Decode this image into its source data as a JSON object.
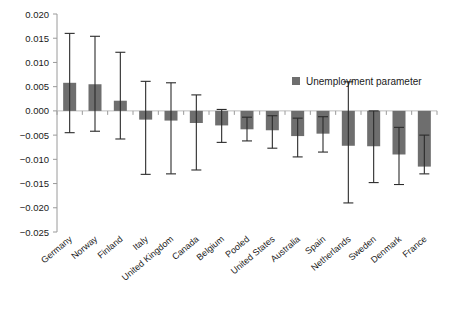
{
  "chart_data": {
    "type": "bar",
    "title": "",
    "xlabel": "",
    "ylabel": "",
    "ylim": [
      -0.025,
      0.02
    ],
    "ytick_values": [
      0.02,
      0.015,
      0.01,
      0.005,
      0.0,
      -0.005,
      -0.01,
      -0.015,
      -0.02,
      -0.025
    ],
    "ytick_labels": [
      "0.020",
      "0.015",
      "0.010",
      "0.005",
      "0.000",
      "−0.005",
      "−0.010",
      "−0.015",
      "−0.020",
      "−0.025"
    ],
    "grid": false,
    "legend": {
      "position": "inside-top-right",
      "entries": [
        {
          "name": "Unemployment parameter",
          "color": "#6e6e6e",
          "marker": "square"
        }
      ]
    },
    "categories": [
      "Germany",
      "Norway",
      "Finland",
      "Italy",
      "United Kingdom",
      "Canada",
      "Belgium",
      "Pooled",
      "United States",
      "Australia",
      "Spain",
      "Netherlands",
      "Sweden",
      "Denmark",
      "France"
    ],
    "series": [
      {
        "name": "Unemployment parameter",
        "color": "#6e6e6e",
        "values": [
          0.0058,
          0.0055,
          0.0021,
          -0.0018,
          -0.002,
          -0.0025,
          -0.003,
          -0.0038,
          -0.004,
          -0.0052,
          -0.0047,
          -0.0072,
          -0.0073,
          -0.009,
          -0.0115
        ],
        "error_low": [
          -0.0045,
          -0.0042,
          -0.0058,
          -0.0131,
          -0.013,
          -0.0122,
          -0.0065,
          -0.0062,
          -0.0077,
          -0.0095,
          -0.0085,
          -0.019,
          -0.0148,
          -0.0152,
          -0.013
        ],
        "error_high": [
          0.016,
          0.0154,
          0.0121,
          0.0061,
          0.0058,
          0.0033,
          0.0003,
          -0.0013,
          -0.001,
          -0.0015,
          -0.0012,
          0.006,
          0.0,
          -0.0034,
          -0.005
        ]
      }
    ]
  },
  "axis": {
    "spine_color": "#9a9a9a",
    "zero_line_color": "#bdbdbd",
    "tick_color": "#9a9a9a"
  }
}
